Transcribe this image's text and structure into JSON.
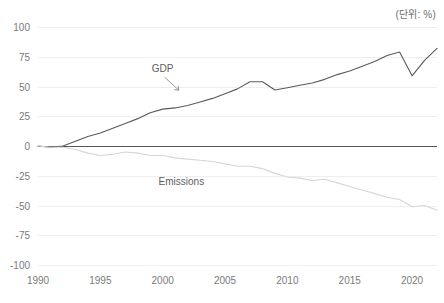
{
  "unit_note": "(단위: %)",
  "chart_data": {
    "type": "line",
    "title": "",
    "subtitle": "",
    "xlabel": "",
    "ylabel": "",
    "unit_note": "(단위: %)",
    "xlim": [
      1990,
      2022
    ],
    "ylim": [
      -100,
      100
    ],
    "grid": true,
    "legend_position": "inline-annotation",
    "y_ticks": [
      100,
      75,
      50,
      25,
      0,
      -25,
      -50,
      -75,
      -100
    ],
    "y_tick_labels": [
      "100",
      "75",
      "50",
      "25",
      "0",
      "-25",
      "-50",
      "-75",
      "-100"
    ],
    "x_ticks": [
      1990,
      1995,
      2000,
      2005,
      2010,
      2015,
      2020
    ],
    "x_tick_labels": [
      "1990",
      "1995",
      "2000",
      "2005",
      "2010",
      "2015",
      "2020"
    ],
    "x": [
      1990,
      1991,
      1992,
      1993,
      1994,
      1995,
      1996,
      1997,
      1998,
      1999,
      2000,
      2001,
      2002,
      2003,
      2004,
      2005,
      2006,
      2007,
      2008,
      2009,
      2010,
      2011,
      2012,
      2013,
      2014,
      2015,
      2016,
      2017,
      2018,
      2019,
      2020,
      2021,
      2022
    ],
    "series": [
      {
        "name": "GDP",
        "label": "GDP",
        "color": "#5a5a5a",
        "values": [
          0,
          -1,
          0,
          4,
          8,
          11,
          15,
          19,
          23,
          28,
          31,
          32,
          34,
          37,
          40,
          44,
          48,
          54,
          54,
          47,
          49,
          51,
          53,
          56,
          60,
          63,
          67,
          71,
          76,
          79,
          59,
          72,
          82
        ]
      },
      {
        "name": "Emissions",
        "label": "Emissions",
        "color": "#d6d6d6",
        "values": [
          0,
          -1,
          -1,
          -3,
          -6,
          -8,
          -7,
          -5,
          -6,
          -8,
          -8,
          -10,
          -11,
          -12,
          -13,
          -15,
          -17,
          -17,
          -19,
          -23,
          -26,
          -27,
          -29,
          -28,
          -31,
          -34,
          -37,
          -40,
          -43,
          -45,
          -51,
          -50,
          -54
        ]
      }
    ],
    "annotations": [
      {
        "name": "gdp-annotation",
        "text": "GDP",
        "x": 2000.0,
        "y": 62
      },
      {
        "name": "emissions-annotation",
        "text": "Emissions",
        "x": 2001.5,
        "y": -33
      }
    ]
  }
}
